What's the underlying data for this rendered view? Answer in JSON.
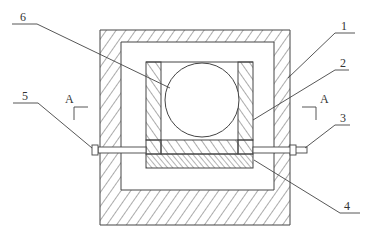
{
  "diagram": {
    "type": "patent-cross-section",
    "colors": {
      "line": "#444444",
      "background": "#ffffff"
    },
    "labels": {
      "part1": "1",
      "part2": "2",
      "part3": "3",
      "part4": "4",
      "part5": "5",
      "part6": "6",
      "section_left": "A",
      "section_right": "A"
    },
    "parts": [
      {
        "id": "1",
        "description": "outer hatched housing frame"
      },
      {
        "id": "2",
        "description": "inner hatched U-shaped holder"
      },
      {
        "id": "3",
        "description": "right rod end / bolt"
      },
      {
        "id": "4",
        "description": "hatched base block"
      },
      {
        "id": "5",
        "description": "left rod end / bolt"
      },
      {
        "id": "6",
        "description": "circular element (ball)"
      }
    ]
  }
}
